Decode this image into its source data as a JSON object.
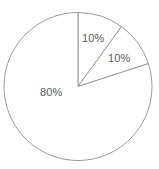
{
  "chart_data": {
    "type": "pie",
    "title": "",
    "subtitle": "",
    "xlabel": "",
    "ylabel": "",
    "grid": false,
    "legend": "none",
    "start_angle_deg": 0,
    "direction": "clockwise",
    "categories": [
      "Slice 1",
      "Slice 2",
      "Slice 3"
    ],
    "values": [
      10,
      10,
      80
    ],
    "labels": [
      "10%",
      "10%",
      "80%"
    ],
    "slices": [
      {
        "label": "10%",
        "value": 10,
        "start_angle_deg": 0,
        "end_angle_deg": 36,
        "fill": "#ffffff",
        "stroke": "#9a9a9a"
      },
      {
        "label": "10%",
        "value": 10,
        "start_angle_deg": 36,
        "end_angle_deg": 72,
        "fill": "#ffffff",
        "stroke": "#9a9a9a"
      },
      {
        "label": "80%",
        "value": 80,
        "start_angle_deg": 72,
        "end_angle_deg": 360,
        "fill": "#ffffff",
        "stroke": "#9a9a9a"
      }
    ],
    "colors": {
      "background": "#ffffff",
      "outline": "#9a9a9a",
      "label_text": "#5b5b5b"
    },
    "geometry": {
      "center_x": 78,
      "center_y": 86.5,
      "radius": 74
    }
  }
}
